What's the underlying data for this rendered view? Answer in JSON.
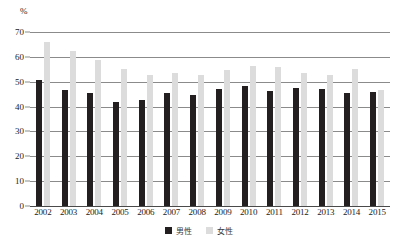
{
  "chart_data": {
    "type": "bar",
    "title": "",
    "subtitle": "",
    "xlabel": "",
    "ylabel": "%",
    "unit_label": "%",
    "ylim": [
      0,
      70
    ],
    "yticks": [
      0,
      10,
      20,
      30,
      40,
      50,
      60,
      70
    ],
    "grid": true,
    "legend_position": "bottom",
    "categories": [
      "2002",
      "2003",
      "2004",
      "2005",
      "2006",
      "2007",
      "2008",
      "2009",
      "2010",
      "2011",
      "2012",
      "2013",
      "2014",
      "2015"
    ],
    "series": [
      {
        "name": "男性",
        "color": "#231f20",
        "values": [
          50.8,
          46.8,
          45.3,
          41.7,
          42.5,
          45.6,
          44.6,
          46.9,
          48.4,
          46.3,
          47.3,
          47.2,
          45.6,
          45.8
        ]
      },
      {
        "name": "女性",
        "color": "#dcdcdc",
        "values": [
          65.8,
          62.3,
          58.7,
          55.2,
          52.8,
          53.5,
          52.9,
          54.6,
          56.4,
          56.0,
          53.6,
          52.6,
          55.0,
          46.6
        ]
      }
    ]
  },
  "axis": {
    "unit": "%",
    "tick_labels": [
      "70",
      "60",
      "50",
      "40",
      "30",
      "20",
      "10",
      "0"
    ]
  },
  "legend": {
    "items": [
      {
        "label": "男性",
        "color": "#231f20"
      },
      {
        "label": "女性",
        "color": "#dcdcdc"
      }
    ]
  }
}
